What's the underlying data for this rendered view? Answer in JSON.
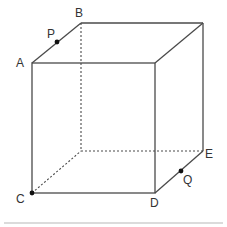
{
  "figure": {
    "type": "cube",
    "vertex_labels": {
      "A": "A",
      "B": "B",
      "C": "C",
      "D": "D",
      "E": "E"
    },
    "point_labels": {
      "P": "P",
      "Q": "Q"
    },
    "points_description": {
      "P": "point on edge AB",
      "Q": "point on edge DE",
      "C": "marked vertex"
    },
    "colors": {
      "edge": "#4a4a4a",
      "point": "#111111",
      "label": "#333333",
      "rule": "#b8b8b8"
    }
  }
}
